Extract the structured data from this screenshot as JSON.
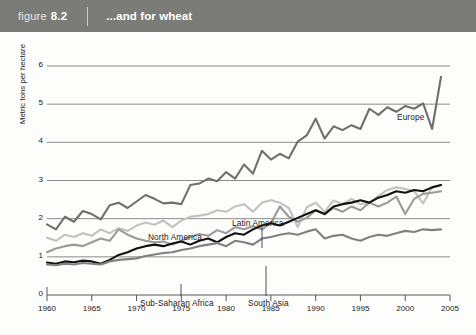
{
  "header": {
    "figure_word": "figure",
    "figure_number": "8.2",
    "title": "...and for wheat"
  },
  "colors": {
    "header_bg": "#7b7b78",
    "page_bg": "#fdfdfc",
    "axis": "#58585a",
    "grid": "#6e6e70",
    "europe": "#6f6f70",
    "north_america": "#c2c2c2",
    "latin_america": "#9a9a9a",
    "south_asia": "#111111",
    "sub_saharan_africa": "#808083",
    "text": "#1a1a1a"
  },
  "chart_data": {
    "type": "line",
    "title": "...and for wheat",
    "xlabel": "",
    "ylabel": "Metric tons per hectare",
    "xlim": [
      1960,
      2005
    ],
    "ylim": [
      0,
      6
    ],
    "xticks": [
      1960,
      1965,
      1970,
      1975,
      1980,
      1985,
      1990,
      1995,
      2000,
      2005
    ],
    "yticks": [
      0,
      1,
      2,
      3,
      4,
      5,
      6
    ],
    "gridlines_y": [
      1,
      2,
      3,
      4,
      5,
      6
    ],
    "grid": true,
    "legend": "inline-annotations",
    "x": [
      1960,
      1961,
      1962,
      1963,
      1964,
      1965,
      1966,
      1967,
      1968,
      1969,
      1970,
      1971,
      1972,
      1973,
      1974,
      1975,
      1976,
      1977,
      1978,
      1979,
      1980,
      1981,
      1982,
      1983,
      1984,
      1985,
      1986,
      1987,
      1988,
      1989,
      1990,
      1991,
      1992,
      1993,
      1994,
      1995,
      1996,
      1997,
      1998,
      1999,
      2000,
      2001,
      2002,
      2003,
      2004
    ],
    "series": [
      {
        "name": "Europe",
        "color": "#6f6f70",
        "label_x": 2000,
        "label_y": 5.45,
        "values": [
          1.85,
          1.72,
          2.05,
          1.92,
          2.2,
          2.12,
          1.98,
          2.35,
          2.42,
          2.28,
          2.45,
          2.62,
          2.52,
          2.4,
          2.42,
          2.38,
          2.88,
          2.92,
          3.05,
          2.98,
          3.22,
          3.05,
          3.42,
          3.18,
          3.78,
          3.55,
          3.7,
          3.58,
          4.02,
          4.18,
          4.62,
          4.1,
          4.42,
          4.32,
          4.45,
          4.35,
          4.88,
          4.72,
          4.92,
          4.8,
          4.95,
          4.88,
          5.02,
          4.35,
          5.72
        ]
      },
      {
        "name": "North America",
        "color": "#c2c2c2",
        "label_x": 1972,
        "label_y": 2.22,
        "values": [
          1.5,
          1.42,
          1.58,
          1.52,
          1.62,
          1.55,
          1.72,
          1.62,
          1.75,
          1.68,
          1.82,
          1.9,
          1.84,
          1.95,
          1.78,
          1.95,
          2.05,
          2.08,
          2.12,
          2.22,
          2.18,
          2.32,
          2.38,
          2.18,
          2.42,
          2.48,
          2.42,
          2.28,
          1.78,
          2.3,
          2.42,
          2.18,
          2.48,
          2.38,
          2.52,
          2.38,
          2.42,
          2.6,
          2.75,
          2.82,
          2.78,
          2.72,
          2.4,
          2.82,
          2.88
        ]
      },
      {
        "name": "Latin America",
        "color": "#9a9a9a",
        "label_x": 1981,
        "label_y": 2.72,
        "values": [
          1.12,
          1.22,
          1.28,
          1.32,
          1.28,
          1.38,
          1.48,
          1.42,
          1.72,
          1.58,
          1.48,
          1.42,
          1.38,
          1.4,
          1.32,
          1.42,
          1.52,
          1.6,
          1.55,
          1.7,
          1.62,
          1.78,
          1.72,
          1.8,
          1.72,
          1.88,
          2.32,
          2.05,
          1.92,
          2.02,
          2.22,
          2.12,
          2.28,
          2.18,
          2.32,
          2.22,
          2.42,
          2.32,
          2.42,
          2.58,
          2.12,
          2.52,
          2.65,
          2.68,
          2.72
        ]
      },
      {
        "name": "South Asia",
        "color": "#111111",
        "label_x": 1986,
        "label_y": 0.72,
        "values": [
          0.85,
          0.82,
          0.88,
          0.86,
          0.9,
          0.88,
          0.82,
          0.92,
          1.05,
          1.12,
          1.22,
          1.28,
          1.32,
          1.28,
          1.35,
          1.4,
          1.32,
          1.42,
          1.48,
          1.38,
          1.52,
          1.62,
          1.58,
          1.72,
          1.82,
          1.88,
          1.82,
          1.92,
          2.02,
          2.12,
          2.22,
          2.12,
          2.32,
          2.38,
          2.42,
          2.48,
          2.42,
          2.55,
          2.62,
          2.72,
          2.68,
          2.75,
          2.72,
          2.82,
          2.88
        ]
      },
      {
        "name": "Sub-Saharan Africa",
        "color": "#808083",
        "label_x": 1975,
        "label_y": 0.72,
        "values": [
          0.8,
          0.78,
          0.82,
          0.8,
          0.84,
          0.82,
          0.8,
          0.88,
          0.92,
          0.94,
          0.96,
          1.02,
          1.06,
          1.1,
          1.12,
          1.18,
          1.22,
          1.28,
          1.32,
          1.36,
          1.28,
          1.42,
          1.38,
          1.32,
          1.48,
          1.52,
          1.58,
          1.62,
          1.58,
          1.66,
          1.72,
          1.48,
          1.55,
          1.58,
          1.48,
          1.42,
          1.52,
          1.58,
          1.55,
          1.62,
          1.68,
          1.65,
          1.72,
          1.7,
          1.72
        ]
      }
    ],
    "annotations": [
      {
        "name": "europe-label",
        "text": "Europe",
        "x": 397,
        "y": 80,
        "leader": false
      },
      {
        "name": "north-america-label",
        "text": "North America",
        "x": 148,
        "y": 200,
        "leader": false
      },
      {
        "name": "latin-america-label",
        "text": "Latin America",
        "x": 232,
        "y": 186,
        "leader": true,
        "leader_x": 262,
        "leader_y1": 194,
        "leader_y2": 216
      },
      {
        "name": "sub-saharan-africa-label",
        "text": "Sub-Saharan Africa",
        "x": 140,
        "y": 266,
        "leader": true,
        "leader_x": 181,
        "leader_y1": 252,
        "leader_y2": 264
      },
      {
        "name": "south-asia-label",
        "text": "South Asia",
        "x": 248,
        "y": 266,
        "leader": true,
        "leader_x": 266,
        "leader_y1": 234,
        "leader_y2": 264
      }
    ]
  }
}
